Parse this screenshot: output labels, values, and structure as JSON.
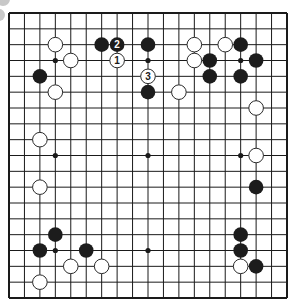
{
  "board": {
    "size": 19,
    "colors": {
      "line": "#1a1a1a",
      "black_stone": "#1c1c1c",
      "white_stone": "#ffffff",
      "white_stone_border": "#2a2a2a",
      "label_on_black": "#ffffff",
      "label_on_white": "#1a1a1a",
      "background": "#ffffff"
    },
    "star_points": [
      [
        3,
        3
      ],
      [
        9,
        3
      ],
      [
        15,
        3
      ],
      [
        3,
        9
      ],
      [
        9,
        9
      ],
      [
        15,
        9
      ],
      [
        3,
        15
      ],
      [
        9,
        15
      ],
      [
        15,
        15
      ]
    ],
    "stones": [
      {
        "col": 6,
        "row": 2,
        "color": "black",
        "label": ""
      },
      {
        "col": 7,
        "row": 2,
        "color": "black",
        "label": "2"
      },
      {
        "col": 7,
        "row": 3,
        "color": "white",
        "label": "1"
      },
      {
        "col": 9,
        "row": 2,
        "color": "black",
        "label": ""
      },
      {
        "col": 9,
        "row": 4,
        "color": "white",
        "label": "3"
      },
      {
        "col": 9,
        "row": 5,
        "color": "black",
        "label": ""
      },
      {
        "col": 11,
        "row": 5,
        "color": "white",
        "label": ""
      },
      {
        "col": 12,
        "row": 2,
        "color": "white",
        "label": ""
      },
      {
        "col": 14,
        "row": 2,
        "color": "white",
        "label": ""
      },
      {
        "col": 15,
        "row": 2,
        "color": "black",
        "label": ""
      },
      {
        "col": 12,
        "row": 3,
        "color": "white",
        "label": ""
      },
      {
        "col": 13,
        "row": 3,
        "color": "black",
        "label": ""
      },
      {
        "col": 16,
        "row": 3,
        "color": "black",
        "label": ""
      },
      {
        "col": 13,
        "row": 4,
        "color": "black",
        "label": ""
      },
      {
        "col": 15,
        "row": 4,
        "color": "black",
        "label": ""
      },
      {
        "col": 16,
        "row": 6,
        "color": "white",
        "label": ""
      },
      {
        "col": 3,
        "row": 2,
        "color": "white",
        "label": ""
      },
      {
        "col": 4,
        "row": 3,
        "color": "white",
        "label": ""
      },
      {
        "col": 2,
        "row": 4,
        "color": "black",
        "label": ""
      },
      {
        "col": 3,
        "row": 5,
        "color": "white",
        "label": ""
      },
      {
        "col": 2,
        "row": 8,
        "color": "white",
        "label": ""
      },
      {
        "col": 2,
        "row": 11,
        "color": "white",
        "label": ""
      },
      {
        "col": 16,
        "row": 9,
        "color": "white",
        "label": ""
      },
      {
        "col": 16,
        "row": 11,
        "color": "black",
        "label": ""
      },
      {
        "col": 3,
        "row": 14,
        "color": "black",
        "label": ""
      },
      {
        "col": 2,
        "row": 15,
        "color": "black",
        "label": ""
      },
      {
        "col": 5,
        "row": 15,
        "color": "black",
        "label": ""
      },
      {
        "col": 4,
        "row": 16,
        "color": "white",
        "label": ""
      },
      {
        "col": 6,
        "row": 16,
        "color": "white",
        "label": ""
      },
      {
        "col": 2,
        "row": 17,
        "color": "white",
        "label": ""
      },
      {
        "col": 15,
        "row": 14,
        "color": "black",
        "label": ""
      },
      {
        "col": 15,
        "row": 15,
        "color": "black",
        "label": ""
      },
      {
        "col": 15,
        "row": 16,
        "color": "white",
        "label": ""
      },
      {
        "col": 16,
        "row": 16,
        "color": "black",
        "label": ""
      }
    ]
  }
}
